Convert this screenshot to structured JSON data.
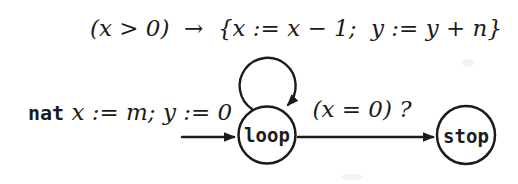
{
  "diagram": {
    "self_loop_label": "(x > 0)  →  {x := x − 1;  y := y + n}",
    "init_label": {
      "keyword": "nat",
      "assignments": " x := m; y := 0"
    },
    "guard_label": "(x = 0) ?",
    "states": [
      {
        "name": "loop"
      },
      {
        "name": "stop"
      }
    ],
    "colors": {
      "ink": "#1b1b1b",
      "background": "#ffffff",
      "smudge": "#e9e9e6"
    }
  }
}
